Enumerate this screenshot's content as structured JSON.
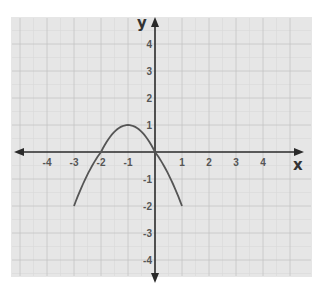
{
  "caption": "graph of y = f(x)",
  "colors": {
    "background": "#e6e6e6",
    "grid_major": "#c4c4c4",
    "grid_minor": "#d8d8d8",
    "axis": "#2a2a2a",
    "curve": "#555555"
  },
  "axes": {
    "x_label": "x",
    "y_label": "y",
    "x_ticks": [
      "-4",
      "-3",
      "-2",
      "-1",
      "1",
      "2",
      "3",
      "4"
    ],
    "y_ticks": [
      "4",
      "3",
      "2",
      "1",
      "-1",
      "-2",
      "-3",
      "-4"
    ]
  },
  "chart_data": {
    "type": "line",
    "title": "",
    "xlabel": "x",
    "ylabel": "y",
    "xlim": [
      -5,
      5
    ],
    "ylim": [
      -4.5,
      4.5
    ],
    "grid": true,
    "series": [
      {
        "name": "parabola",
        "equation": "y = -x^2 - 2x",
        "x": [
          -3,
          -2.5,
          -2,
          -1.5,
          -1,
          -0.5,
          0,
          0.5,
          1
        ],
        "y": [
          -3,
          -1.25,
          0,
          0.75,
          1,
          0.75,
          0,
          -1.25,
          -3
        ],
        "endpoints": [
          [
            -3,
            -2
          ],
          [
            1,
            -2
          ]
        ],
        "vertex": [
          -1,
          1
        ],
        "x_intercepts": [
          -2,
          0
        ]
      }
    ]
  }
}
